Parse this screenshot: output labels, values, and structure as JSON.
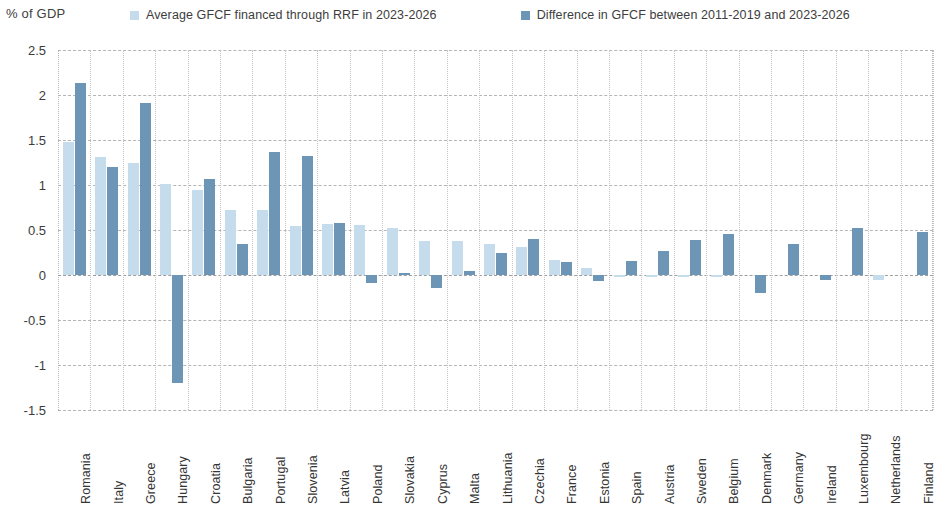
{
  "axis_unit_label": "% of GDP",
  "legend": {
    "items": [
      {
        "label": "Average GFCF financed through RRF in 2023-2026",
        "color": "#c5dcec",
        "key": "light"
      },
      {
        "label": "Difference in GFCF between 2011-2019 and 2023-2026",
        "color": "#6d95b6",
        "key": "dark"
      }
    ]
  },
  "yaxis": {
    "ticks": [
      "2.5",
      "2",
      "1.5",
      "1",
      "0.5",
      "0",
      "-0.5",
      "-1",
      "-1.5"
    ],
    "min": -1.5,
    "max": 2.5,
    "step": 0.5
  },
  "chart_data": {
    "type": "bar",
    "title": "",
    "subtitle": "",
    "xlabel": "",
    "ylabel": "% of GDP",
    "ylim": [
      -1.5,
      2.5
    ],
    "ytick_step": 0.5,
    "grid": true,
    "legend_position": "top",
    "orientation": "vertical",
    "grouping": "grouped",
    "categories": [
      "Romania",
      "Italy",
      "Greece",
      "Hungary",
      "Croatia",
      "Bulgaria",
      "Portugal",
      "Slovenia",
      "Latvia",
      "Poland",
      "Slovakia",
      "Cyprus",
      "Malta",
      "Lithuania",
      "Czechia",
      "France",
      "Estonia",
      "Spain",
      "Austria",
      "Sweden",
      "Belgium",
      "Denmark",
      "Germany",
      "Ireland",
      "Luxembourg",
      "Netherlands",
      "Finland"
    ],
    "series": [
      {
        "name": "Average GFCF financed through RRF in 2023-2026",
        "color": "#c5dcec",
        "values": [
          1.48,
          1.31,
          1.24,
          1.01,
          0.94,
          0.72,
          0.72,
          0.55,
          0.57,
          0.56,
          0.52,
          0.38,
          0.38,
          0.35,
          0.31,
          0.17,
          0.08,
          -0.02,
          -0.02,
          -0.01,
          -0.01,
          0.0,
          0.0,
          0.0,
          0.0,
          -0.05,
          0.0
        ]
      },
      {
        "name": "Difference in GFCF between 2011-2019 and 2023-2026",
        "color": "#6d95b6",
        "values": [
          2.13,
          1.2,
          1.91,
          -1.2,
          1.07,
          0.34,
          1.37,
          1.32,
          0.58,
          -0.09,
          0.02,
          -0.14,
          0.04,
          0.25,
          0.4,
          0.14,
          -0.07,
          0.16,
          0.27,
          0.39,
          0.46,
          -0.2,
          0.34,
          -0.05,
          0.52,
          0.0,
          0.48
        ]
      }
    ]
  }
}
